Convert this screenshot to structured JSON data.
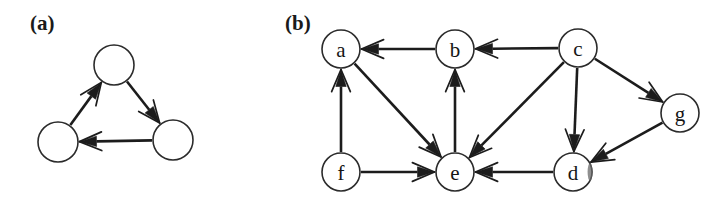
{
  "figure": {
    "caption_a": "(a)",
    "caption_b": "(b)",
    "background_color": "#ffffff",
    "ink_color": "#1c1c1c"
  },
  "panel_a": {
    "label": "(a)",
    "label_x": 30,
    "label_y": 30,
    "node_radius": 20,
    "nodes": [
      {
        "id": "a-top",
        "label": "",
        "x": 114,
        "y": 65
      },
      {
        "id": "a-left",
        "label": "",
        "x": 58,
        "y": 142
      },
      {
        "id": "a-right",
        "label": "",
        "x": 173,
        "y": 140
      }
    ],
    "edges": [
      {
        "from": "a-left",
        "to": "a-top"
      },
      {
        "from": "a-top",
        "to": "a-right"
      },
      {
        "from": "a-right",
        "to": "a-left"
      }
    ]
  },
  "panel_b": {
    "label": "(b)",
    "label_x": 285,
    "label_y": 30,
    "node_radius": 19,
    "nodes": [
      {
        "id": "a",
        "label": "a",
        "x": 341,
        "y": 49
      },
      {
        "id": "b",
        "label": "b",
        "x": 455,
        "y": 49
      },
      {
        "id": "c",
        "label": "c",
        "x": 578,
        "y": 48
      },
      {
        "id": "g",
        "label": "g",
        "x": 680,
        "y": 113
      },
      {
        "id": "f",
        "label": "f",
        "x": 341,
        "y": 172
      },
      {
        "id": "e",
        "label": "e",
        "x": 455,
        "y": 172
      },
      {
        "id": "d",
        "label": "d",
        "x": 573,
        "y": 172
      }
    ],
    "edges": [
      {
        "from": "b",
        "to": "a"
      },
      {
        "from": "c",
        "to": "b"
      },
      {
        "from": "c",
        "to": "g"
      },
      {
        "from": "c",
        "to": "e"
      },
      {
        "from": "c",
        "to": "d"
      },
      {
        "from": "g",
        "to": "d"
      },
      {
        "from": "d",
        "to": "e"
      },
      {
        "from": "f",
        "to": "a"
      },
      {
        "from": "f",
        "to": "e"
      },
      {
        "from": "a",
        "to": "e"
      },
      {
        "from": "e",
        "to": "b"
      }
    ]
  }
}
